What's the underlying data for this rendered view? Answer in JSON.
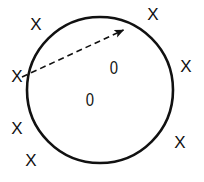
{
  "figure": {
    "background_color": "#ffffff",
    "stroke_color": "#111111",
    "width": 204,
    "height": 182
  },
  "circle": {
    "label": "circle-outline",
    "cx": 100,
    "cy": 90,
    "r": 73,
    "stroke_width": 2.6,
    "fill": "none",
    "stroke_color": "#111111"
  },
  "arrow": {
    "label": "dashed-arrow",
    "style": "dashed",
    "x1": 22,
    "y1": 77,
    "x2": 128,
    "y2": 28,
    "stroke_width": 1.6,
    "dash_pattern": "6 4",
    "head_length": 9,
    "head_width": 5,
    "stroke_color": "#111111"
  },
  "marks": {
    "exterior": [
      {
        "text": "X",
        "x": 36,
        "y": 24
      },
      {
        "text": "X",
        "x": 153,
        "y": 14
      },
      {
        "text": "X",
        "x": 17,
        "y": 76
      },
      {
        "text": "X",
        "x": 186,
        "y": 66
      },
      {
        "text": "X",
        "x": 17,
        "y": 128
      },
      {
        "text": "X",
        "x": 180,
        "y": 142
      },
      {
        "text": "X",
        "x": 31,
        "y": 160
      }
    ],
    "interior": [
      {
        "text": "0",
        "x": 114,
        "y": 67
      },
      {
        "text": "0",
        "x": 90,
        "y": 99
      }
    ]
  }
}
